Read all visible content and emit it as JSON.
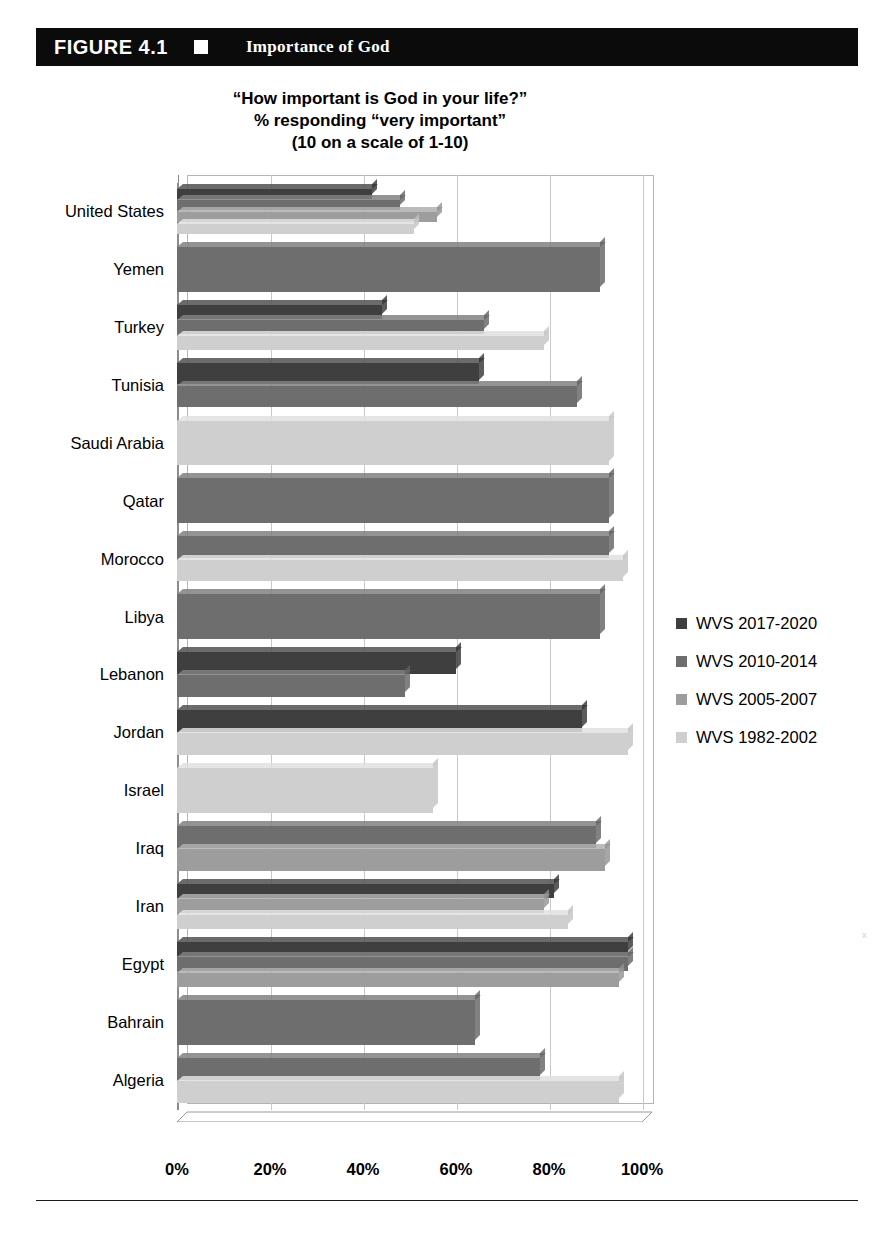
{
  "figure": {
    "number": "FIGURE 4.1",
    "marker_icon": "white-square-icon",
    "title": "Importance of God"
  },
  "chart_title": {
    "line1": "“How important is God in your life?”",
    "line2": "% responding “very important”",
    "line3": "(10 on a scale of 1-10)"
  },
  "legend": {
    "position": "right",
    "items": [
      {
        "label": "WVS 2017-2020",
        "color": "#3f3f3f"
      },
      {
        "label": "WVS 2010-2014",
        "color": "#6e6e6e"
      },
      {
        "label": "WVS 2005-2007",
        "color": "#9d9d9d"
      },
      {
        "label": "WVS 1982-2002",
        "color": "#cfcfcf"
      }
    ]
  },
  "axis": {
    "x_ticks": [
      "0%",
      "20%",
      "40%",
      "60%",
      "80%",
      "100%"
    ],
    "x_values": [
      0,
      20,
      40,
      60,
      80,
      100
    ]
  },
  "chart_data": {
    "type": "bar",
    "orientation": "horizontal",
    "title": "“How important is God in your life?” % responding “very important” (10 on a scale of 1-10)",
    "xlabel": "",
    "ylabel": "",
    "xlim": [
      0,
      100
    ],
    "grid": true,
    "legend_position": "right",
    "categories": [
      "United States",
      "Yemen",
      "Turkey",
      "Tunisia",
      "Saudi Arabia",
      "Qatar",
      "Morocco",
      "Libya",
      "Lebanon",
      "Jordan",
      "Israel",
      "Iraq",
      "Iran",
      "Egypt",
      "Bahrain",
      "Algeria"
    ],
    "series": [
      {
        "name": "WVS 2017-2020",
        "color": "#3f3f3f",
        "values": [
          42,
          null,
          44,
          65,
          null,
          null,
          null,
          null,
          60,
          87,
          null,
          null,
          81,
          97,
          null,
          null
        ]
      },
      {
        "name": "WVS 2010-2014",
        "color": "#6e6e6e",
        "values": [
          48,
          91,
          66,
          86,
          null,
          93,
          93,
          91,
          49,
          null,
          null,
          90,
          null,
          97,
          64,
          78
        ]
      },
      {
        "name": "WVS 2005-2007",
        "color": "#9d9d9d",
        "values": [
          56,
          null,
          null,
          null,
          null,
          null,
          null,
          null,
          null,
          null,
          null,
          92,
          79,
          95,
          null,
          null
        ]
      },
      {
        "name": "WVS 1982-2002",
        "color": "#cfcfcf",
        "values": [
          51,
          null,
          79,
          null,
          93,
          null,
          96,
          null,
          null,
          97,
          55,
          null,
          84,
          null,
          null,
          95
        ]
      }
    ]
  }
}
